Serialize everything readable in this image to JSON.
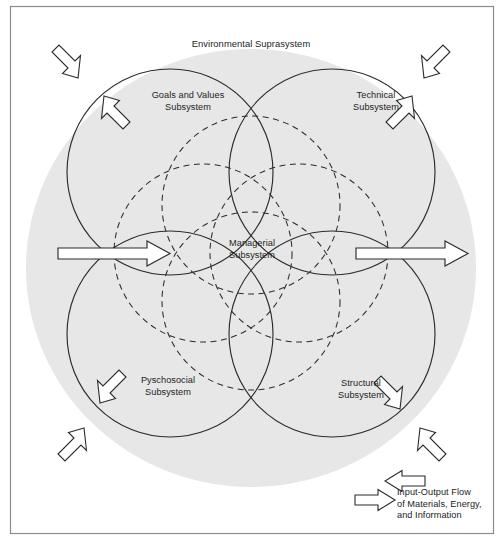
{
  "figure": {
    "title": "Environmental Suprasystem",
    "type": "venn-overlap-systems-diagram"
  },
  "suprasystem": {
    "label": "Environmental Suprasystem"
  },
  "subsystems": [
    {
      "id": "goals-and-values",
      "label": "Goals and Values\nSubsystem",
      "position": "top-left",
      "arrow": "up-left"
    },
    {
      "id": "technical",
      "label": "Technical\nSubsystem",
      "position": "top-right",
      "arrow": "up-right"
    },
    {
      "id": "psychosocial",
      "label": "Pyschosocial\nSubsystem",
      "position": "bottom-left",
      "arrow": "down-left"
    },
    {
      "id": "structural",
      "label": "Structural\nSubsystem",
      "position": "bottom-right",
      "arrow": "down-right"
    },
    {
      "id": "managerial",
      "label": "Managerial\nSubsystem",
      "position": "center",
      "arrow": "none"
    }
  ],
  "legend": {
    "text": "Input-Output Flow\nof Materials, Energy,\nand Information",
    "arrows": [
      "arrow-left",
      "arrow-right"
    ]
  },
  "flow_arrows": {
    "input": "arrow-right-input",
    "output": "arrow-right-output",
    "corners": [
      {
        "id": "corner-top-left",
        "direction": "down-right"
      },
      {
        "id": "corner-top-right",
        "direction": "down-left"
      },
      {
        "id": "corner-bottom-left",
        "direction": "up-right"
      },
      {
        "id": "corner-bottom-right",
        "direction": "up-left"
      }
    ]
  },
  "colors": {
    "background": "#ffffff",
    "suprasystem_fill": "#e6e6e6",
    "stroke": "#2b2b2b",
    "border": "#8c8c8c",
    "text": "#1d1d1d"
  }
}
